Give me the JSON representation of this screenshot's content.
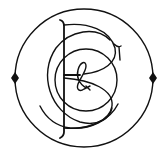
{
  "emblem": {
    "description": "Circular monogram emblem with intertwined letters",
    "letters": "PBC&",
    "ink_color": "#111111",
    "background_color": "#ffffff",
    "outer_circle": {
      "cx": 84,
      "cy": 78,
      "r": 69
    },
    "markers": [
      {
        "shape": "diamond",
        "x": 15,
        "y": 78
      },
      {
        "shape": "diamond",
        "x": 153,
        "y": 78
      }
    ]
  }
}
